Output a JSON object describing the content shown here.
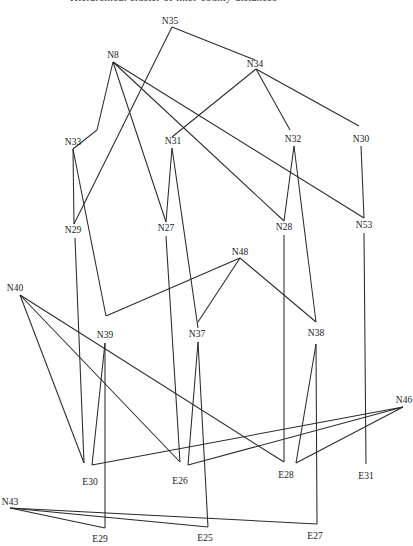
{
  "header": {
    "title": "Hierarchical cluster of inter-county distances"
  },
  "diagram": {
    "type": "tree-lattice",
    "nodes": [
      {
        "id": "N35",
        "label": "N35",
        "x": 170,
        "y": 24,
        "ax": 172,
        "ay": 27
      },
      {
        "id": "N8",
        "label": "N8",
        "x": 113,
        "y": 58,
        "ax": 113,
        "ay": 62
      },
      {
        "id": "N34",
        "label": "N34",
        "x": 255,
        "y": 67,
        "ax": 256,
        "ay": 69
      },
      {
        "id": "N33",
        "label": "N33",
        "x": 73,
        "y": 145,
        "ax": 73,
        "ay": 149
      },
      {
        "id": "N31",
        "label": "N31",
        "x": 173,
        "y": 144,
        "ax": 172,
        "ay": 148
      },
      {
        "id": "N32",
        "label": "N32",
        "x": 293,
        "y": 142,
        "ax": 294,
        "ay": 146
      },
      {
        "id": "N30",
        "label": "N30",
        "x": 361,
        "y": 142,
        "ax": 361,
        "ay": 146
      },
      {
        "id": "N29",
        "label": "N29",
        "x": 73,
        "y": 233,
        "ax": 74,
        "ay": 238
      },
      {
        "id": "N27",
        "label": "N27",
        "x": 166,
        "y": 231,
        "ax": 166,
        "ay": 236
      },
      {
        "id": "N28",
        "label": "N28",
        "x": 284,
        "y": 230,
        "ax": 284,
        "ay": 235
      },
      {
        "id": "N53",
        "label": "N53",
        "x": 364,
        "y": 228,
        "ax": 364,
        "ay": 233
      },
      {
        "id": "N48",
        "label": "N48",
        "x": 240,
        "y": 255,
        "ax": 240,
        "ay": 258
      },
      {
        "id": "N40",
        "label": "N40",
        "x": 15,
        "y": 291,
        "ax": 20,
        "ay": 295
      },
      {
        "id": "N39",
        "label": "N39",
        "x": 105,
        "y": 338,
        "ax": 105,
        "ay": 343
      },
      {
        "id": "N37",
        "label": "N37",
        "x": 197,
        "y": 337,
        "ax": 198,
        "ay": 342
      },
      {
        "id": "N38",
        "label": "N38",
        "x": 316,
        "y": 336,
        "ax": 316,
        "ay": 344
      },
      {
        "id": "N46",
        "label": "N46",
        "x": 404,
        "y": 403,
        "ax": 403,
        "ay": 407
      },
      {
        "id": "E30",
        "label": "E30",
        "x": 90,
        "y": 485
      },
      {
        "id": "E26",
        "label": "E26",
        "x": 180,
        "y": 484
      },
      {
        "id": "E28",
        "label": "E28",
        "x": 286,
        "y": 478
      },
      {
        "id": "E31",
        "label": "E31",
        "x": 366,
        "y": 479
      },
      {
        "id": "N43",
        "label": "N43",
        "x": 10,
        "y": 505,
        "ax": 10,
        "ay": 508
      },
      {
        "id": "E29",
        "label": "E29",
        "x": 100,
        "y": 542
      },
      {
        "id": "E25",
        "label": "E25",
        "x": 205,
        "y": 541
      },
      {
        "id": "E27",
        "label": "E27",
        "x": 315,
        "y": 539
      }
    ],
    "edges": [
      {
        "from": "N35",
        "to": "N34",
        "points": [
          [
            172,
            27
          ],
          [
            255,
            60
          ]
        ]
      },
      {
        "from": "N35",
        "to": "N29",
        "points": [
          [
            172,
            27
          ],
          [
            74,
            224
          ]
        ]
      },
      {
        "from": "N8",
        "to": "N33",
        "points": [
          [
            113,
            62
          ],
          [
            97,
            130
          ],
          [
            73,
            149
          ]
        ]
      },
      {
        "from": "N8",
        "to": "N27",
        "points": [
          [
            113,
            62
          ],
          [
            166,
            222
          ]
        ]
      },
      {
        "from": "N8",
        "to": "N28",
        "points": [
          [
            113,
            62
          ],
          [
            284,
            221
          ]
        ]
      },
      {
        "from": "N8",
        "to": "N53",
        "points": [
          [
            113,
            62
          ],
          [
            364,
            218
          ]
        ]
      },
      {
        "from": "N34",
        "to": "N31",
        "points": [
          [
            256,
            69
          ],
          [
            172,
            137
          ]
        ]
      },
      {
        "from": "N34",
        "to": "N32",
        "points": [
          [
            256,
            69
          ],
          [
            290,
            130
          ]
        ]
      },
      {
        "from": "N34",
        "to": "N30",
        "points": [
          [
            256,
            69
          ],
          [
            359,
            126
          ]
        ]
      },
      {
        "from": "N33",
        "to": "N29",
        "points": [
          [
            73,
            149
          ],
          [
            74,
            224
          ]
        ]
      },
      {
        "from": "N33",
        "to": "N39",
        "points": [
          [
            73,
            149
          ],
          [
            106,
            316
          ]
        ]
      },
      {
        "from": "N31",
        "to": "N27",
        "points": [
          [
            172,
            148
          ],
          [
            166,
            222
          ]
        ]
      },
      {
        "from": "N31",
        "to": "N37",
        "points": [
          [
            172,
            148
          ],
          [
            198,
            328
          ]
        ]
      },
      {
        "from": "N32",
        "to": "N28",
        "points": [
          [
            294,
            146
          ],
          [
            284,
            221
          ]
        ]
      },
      {
        "from": "N32",
        "to": "N38",
        "points": [
          [
            294,
            146
          ],
          [
            316,
            322
          ]
        ]
      },
      {
        "from": "N30",
        "to": "N53",
        "points": [
          [
            361,
            146
          ],
          [
            364,
            218
          ]
        ]
      },
      {
        "from": "N48",
        "to": "N39",
        "points": [
          [
            240,
            258
          ],
          [
            106,
            316
          ]
        ]
      },
      {
        "from": "N48",
        "to": "N37",
        "points": [
          [
            240,
            258
          ],
          [
            198,
            322
          ]
        ]
      },
      {
        "from": "N48",
        "to": "N38",
        "points": [
          [
            240,
            258
          ],
          [
            316,
            322
          ]
        ]
      },
      {
        "from": "N29",
        "to": "E30",
        "points": [
          [
            75,
            238
          ],
          [
            84,
            463
          ]
        ]
      },
      {
        "from": "N27",
        "to": "E26",
        "points": [
          [
            166,
            236
          ],
          [
            180,
            462
          ]
        ]
      },
      {
        "from": "N28",
        "to": "E28",
        "points": [
          [
            284,
            235
          ],
          [
            284,
            462
          ]
        ]
      },
      {
        "from": "N53",
        "to": "E31",
        "points": [
          [
            364,
            233
          ],
          [
            366,
            464
          ]
        ]
      },
      {
        "from": "N40",
        "to": "E30",
        "points": [
          [
            20,
            295
          ],
          [
            84,
            463
          ]
        ]
      },
      {
        "from": "N40",
        "to": "E26",
        "points": [
          [
            20,
            295
          ],
          [
            180,
            462
          ]
        ]
      },
      {
        "from": "N40",
        "to": "E28",
        "points": [
          [
            20,
            295
          ],
          [
            284,
            462
          ]
        ]
      },
      {
        "from": "N39",
        "to": "E30",
        "points": [
          [
            105,
            343
          ],
          [
            92,
            465
          ]
        ]
      },
      {
        "from": "N39",
        "to": "E29",
        "points": [
          [
            105,
            343
          ],
          [
            105,
            528
          ]
        ]
      },
      {
        "from": "N37",
        "to": "E26",
        "points": [
          [
            198,
            342
          ],
          [
            188,
            465
          ]
        ]
      },
      {
        "from": "N37",
        "to": "E25",
        "points": [
          [
            198,
            342
          ],
          [
            208,
            527
          ]
        ]
      },
      {
        "from": "N38",
        "to": "E28",
        "points": [
          [
            316,
            344
          ],
          [
            296,
            463
          ]
        ]
      },
      {
        "from": "N38",
        "to": "E27",
        "points": [
          [
            316,
            344
          ],
          [
            317,
            524
          ]
        ]
      },
      {
        "from": "N46",
        "to": "E30",
        "points": [
          [
            403,
            407
          ],
          [
            92,
            465
          ]
        ]
      },
      {
        "from": "N46",
        "to": "E26",
        "points": [
          [
            403,
            407
          ],
          [
            188,
            465
          ]
        ]
      },
      {
        "from": "N46",
        "to": "E28",
        "points": [
          [
            403,
            407
          ],
          [
            296,
            463
          ]
        ]
      },
      {
        "from": "N43",
        "to": "E29",
        "points": [
          [
            10,
            508
          ],
          [
            105,
            528
          ]
        ]
      },
      {
        "from": "N43",
        "to": "E25",
        "points": [
          [
            10,
            508
          ],
          [
            208,
            527
          ]
        ]
      },
      {
        "from": "N43",
        "to": "E27",
        "points": [
          [
            10,
            508
          ],
          [
            317,
            524
          ]
        ]
      }
    ]
  }
}
